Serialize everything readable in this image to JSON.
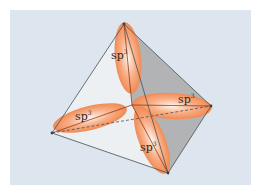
{
  "diagram": {
    "colors": {
      "background": "#dde6ee",
      "lobe": "#f0834a",
      "lobe_highlight": "#fff3ea",
      "shaded_face": "#a9a9a9",
      "light_face": "#eef1f3",
      "edge": "#4a4f55"
    },
    "vertices": {
      "top": [
        124,
        24
      ],
      "left": [
        52,
        133
      ],
      "right": [
        211,
        106
      ],
      "bottom": [
        168,
        173
      ],
      "center": [
        132,
        105
      ]
    },
    "orbitals": [
      {
        "id": "top",
        "label": "sp",
        "superscript": "3"
      },
      {
        "id": "left",
        "label": "sp",
        "superscript": "3"
      },
      {
        "id": "right",
        "label": "sp",
        "superscript": "3"
      },
      {
        "id": "bottom",
        "label": "sp",
        "superscript": "3"
      }
    ]
  }
}
